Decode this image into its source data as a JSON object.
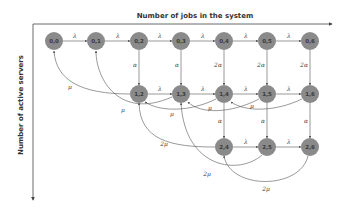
{
  "axes": {
    "x_label": "Number of jobs in the system",
    "y_label": "Number of active servers"
  },
  "colors": {
    "node_fill": "#8a8a8a",
    "edge": "#555555",
    "text": "#333333"
  },
  "nodes": [
    {
      "id": "0,0",
      "label": "0,0"
    },
    {
      "id": "0,1",
      "label": "0,1"
    },
    {
      "id": "0,2",
      "label": "0,2"
    },
    {
      "id": "0,3",
      "label": "0,3"
    },
    {
      "id": "0,4",
      "label": "0,4"
    },
    {
      "id": "0,5",
      "label": "0,5"
    },
    {
      "id": "0,6",
      "label": "0,6"
    },
    {
      "id": "1,2",
      "label": "1,2"
    },
    {
      "id": "1,3",
      "label": "1,3"
    },
    {
      "id": "1,4",
      "label": "1,4"
    },
    {
      "id": "1,5",
      "label": "1,5"
    },
    {
      "id": "1,6",
      "label": "1,6"
    },
    {
      "id": "2,4",
      "label": "2,4"
    },
    {
      "id": "2,5",
      "label": "2,5"
    },
    {
      "id": "2,6",
      "label": "2,6"
    }
  ],
  "edges": [
    {
      "from": "0,0",
      "to": "0,1",
      "label": "λ"
    },
    {
      "from": "0,1",
      "to": "0,2",
      "label": "λ"
    },
    {
      "from": "0,2",
      "to": "0,3",
      "label": "λ"
    },
    {
      "from": "0,3",
      "to": "0,4",
      "label": "λ"
    },
    {
      "from": "0,4",
      "to": "0,5",
      "label": "λ"
    },
    {
      "from": "0,5",
      "to": "0,6",
      "label": "λ"
    },
    {
      "from": "0,2",
      "to": "1,2",
      "label": "α"
    },
    {
      "from": "0,3",
      "to": "1,3",
      "label": "α"
    },
    {
      "from": "0,4",
      "to": "1,4",
      "label": "2α"
    },
    {
      "from": "0,5",
      "to": "1,5",
      "label": "2α"
    },
    {
      "from": "0,6",
      "to": "1,6",
      "label": "2α"
    },
    {
      "from": "1,2",
      "to": "1,3",
      "label": "λ"
    },
    {
      "from": "1,3",
      "to": "1,4",
      "label": "λ"
    },
    {
      "from": "1,4",
      "to": "1,5",
      "label": "λ"
    },
    {
      "from": "1,5",
      "to": "1,6",
      "label": "λ"
    },
    {
      "from": "1,2",
      "to": "0,0",
      "label": "μ"
    },
    {
      "from": "1,3",
      "to": "0,1",
      "label": "μ"
    },
    {
      "from": "1,4",
      "to": "1,2",
      "label": "μ"
    },
    {
      "from": "1,5",
      "to": "1,3",
      "label": "μ"
    },
    {
      "from": "1,6",
      "to": "1,4",
      "label": "μ"
    },
    {
      "from": "1,4",
      "to": "2,4",
      "label": "α"
    },
    {
      "from": "1,5",
      "to": "2,5",
      "label": "α"
    },
    {
      "from": "1,6",
      "to": "2,6",
      "label": "α"
    },
    {
      "from": "2,4",
      "to": "2,5",
      "label": "λ"
    },
    {
      "from": "2,5",
      "to": "2,6",
      "label": "λ"
    },
    {
      "from": "2,4",
      "to": "1,2",
      "label": "2μ"
    },
    {
      "from": "2,5",
      "to": "1,3",
      "label": "2μ"
    },
    {
      "from": "2,6",
      "to": "2,4",
      "label": "2μ"
    }
  ],
  "labels": {
    "lambda": "λ",
    "alpha": "α",
    "two_alpha": "2α",
    "mu": "μ",
    "two_mu": "2μ"
  }
}
